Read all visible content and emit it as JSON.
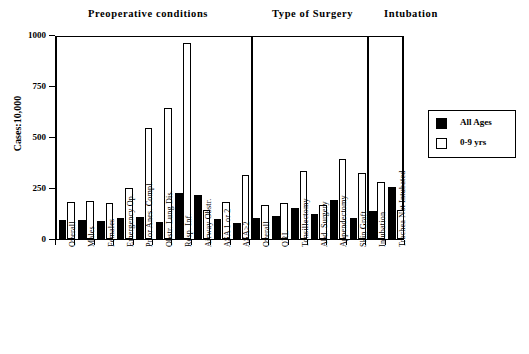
{
  "headers": {
    "preoperative": "Preoperative conditions",
    "surgery": "Type of Surgery",
    "intubation": "Intubation"
  },
  "legend": {
    "items": [
      {
        "label": "All Ages",
        "swatch": "filled-black-square",
        "color": "#000000"
      },
      {
        "label": "0-9 yrs",
        "swatch": "open-white-square",
        "color": "#ffffff"
      }
    ]
  },
  "chart_data": {
    "type": "bar",
    "title": "",
    "xlabel": "",
    "ylabel": "Cases:10,000",
    "ylim": [
      0,
      1000
    ],
    "yticks": [
      0,
      250,
      500,
      750,
      1000
    ],
    "ytick_labels": [
      "0",
      "250",
      "500",
      "750",
      "1000"
    ],
    "grid": false,
    "legend_position": "right-outside",
    "categories": [
      "Overall",
      "Males",
      "Females",
      "Emergency Op.",
      "Prior Anes. Compl.",
      "Obstr. Lung Dis.",
      "Resp. Inf.",
      "Airway Obstr.",
      "ASA 1 or 2",
      "ASA>2",
      "Overall",
      "ORL",
      "Tonsillectomy",
      "Abd. Surgery",
      "Appendectomy",
      "Skin Graft",
      "Intubation",
      "Trachea Not Intubated"
    ],
    "groups": [
      {
        "name": "Preoperative conditions",
        "start": 0,
        "end": 9
      },
      {
        "name": "Type of Surgery",
        "start": 10,
        "end": 15
      },
      {
        "name": "Intubation",
        "start": 16,
        "end": 17
      }
    ],
    "series": [
      {
        "name": "All Ages",
        "color": "#000000",
        "values": [
          95,
          95,
          90,
          105,
          108,
          85,
          228,
          215,
          100,
          80,
          105,
          115,
          150,
          125,
          190,
          105,
          135,
          255
        ]
      },
      {
        "name": "0-9 yrs",
        "color": "#ffffff",
        "values": [
          180,
          185,
          175,
          250,
          545,
          640,
          960,
          140,
          180,
          315,
          165,
          175,
          335,
          165,
          390,
          325,
          280,
          140
        ]
      }
    ]
  }
}
